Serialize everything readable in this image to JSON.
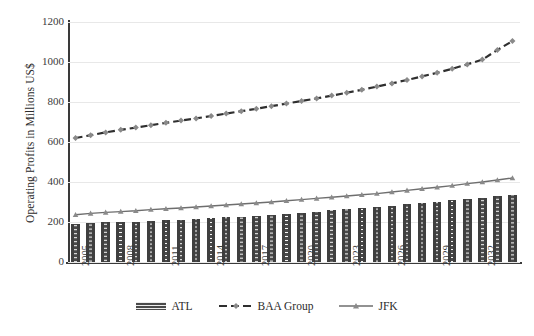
{
  "chart_data": {
    "type": "bar",
    "title": "",
    "xlabel": "",
    "ylabel": "Operating Profits in Millions US$",
    "ylim": [
      0,
      1200
    ],
    "ytick_values": [
      0,
      200,
      400,
      600,
      800,
      1000,
      1200
    ],
    "ytick_labels": [
      "0",
      "200",
      "400",
      "600",
      "800",
      "1000",
      "1200"
    ],
    "grid": true,
    "legend_position": "bottom",
    "x": [
      2005,
      2006,
      2007,
      2008,
      2009,
      2010,
      2011,
      2012,
      2013,
      2014,
      2015,
      2016,
      2017,
      2018,
      2019,
      2020,
      2021,
      2022,
      2023,
      2024,
      2025,
      2026,
      2027,
      2028,
      2029,
      2030,
      2031,
      2032,
      2033,
      2034
    ],
    "categories": [
      "2005",
      "2006",
      "2007",
      "2008",
      "2009",
      "2010",
      "2011",
      "2012",
      "2013",
      "2014",
      "2015",
      "2016",
      "2017",
      "2018",
      "2019",
      "2020",
      "2021",
      "2022",
      "2023",
      "2024",
      "2025",
      "2026",
      "2027",
      "2028",
      "2029",
      "2030",
      "2031",
      "2032",
      "2033",
      "2034"
    ],
    "xtick_labels": [
      "2005",
      "2008",
      "2011",
      "2014",
      "2017",
      "2020",
      "2023",
      "2026",
      "2029",
      "2032"
    ],
    "xtick_values": [
      2005,
      2008,
      2011,
      2014,
      2017,
      2020,
      2023,
      2026,
      2029,
      2032
    ],
    "series": [
      {
        "name": "ATL",
        "render": "bar",
        "color": "#4a4a4a",
        "values": [
          192,
          196,
          198,
          200,
          202,
          206,
          210,
          212,
          215,
          220,
          223,
          227,
          232,
          236,
          240,
          246,
          252,
          258,
          264,
          270,
          276,
          282,
          288,
          295,
          302,
          310,
          316,
          322,
          328,
          334
        ]
      },
      {
        "name": "BAA Group",
        "render": "line-dashed",
        "color": "#808080",
        "marker": "diamond",
        "values": [
          620,
          634,
          648,
          661,
          672,
          684,
          696,
          707,
          718,
          730,
          742,
          754,
          766,
          779,
          792,
          805,
          818,
          832,
          846,
          861,
          877,
          893,
          910,
          928,
          946,
          966,
          988,
          1012,
          1060,
          1105
        ]
      },
      {
        "name": "JFK",
        "render": "line-solid",
        "color": "#6e6e6e",
        "marker": "triangle",
        "values": [
          236,
          243,
          248,
          252,
          256,
          262,
          266,
          270,
          275,
          280,
          285,
          290,
          295,
          300,
          306,
          312,
          318,
          324,
          330,
          336,
          342,
          350,
          358,
          366,
          374,
          382,
          392,
          400,
          410,
          420
        ]
      }
    ]
  },
  "legend": {
    "items": [
      {
        "label": "ATL",
        "swatch": "bar-pattern-swatch"
      },
      {
        "label": "BAA Group",
        "swatch": "dashed-line-diamond-swatch"
      },
      {
        "label": "JFK",
        "swatch": "solid-line-triangle-swatch"
      }
    ]
  },
  "axes": {
    "y_title": "Operating Profits in Millions US$"
  },
  "colors": {
    "bar": "#4a4a4a",
    "baa_line": "#808080",
    "jfk_line": "#6e6e6e",
    "grid": "#e8e8e8",
    "axis": "#3a3a3a",
    "background": "#ffffff"
  }
}
